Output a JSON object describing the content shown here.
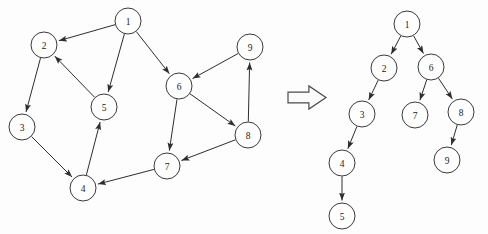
{
  "figure": {
    "width": 488,
    "height": 234,
    "background_color": "#fdfdfd",
    "node_stroke_color": "#3a3a3a",
    "node_fill_color": "#ffffff",
    "edge_color": "#2e2e2e",
    "label_color": "#1a1a1a",
    "node_radius": 13
  },
  "transform_arrow": {
    "name": "rightwards-block-arrow",
    "glyph": "⇒",
    "x": 288,
    "y": 86,
    "width": 38,
    "height": 23,
    "fill": "#fbfbfb",
    "stroke": "#4a4a4a"
  },
  "graph": {
    "name": "source-directed-graph",
    "nodes": [
      {
        "id": "1",
        "label": "1",
        "cx": 128,
        "cy": 21
      },
      {
        "id": "2",
        "label": "2",
        "cx": 44,
        "cy": 45
      },
      {
        "id": "3",
        "label": "3",
        "cx": 22,
        "cy": 127
      },
      {
        "id": "4",
        "label": "4",
        "cx": 83,
        "cy": 188
      },
      {
        "id": "5",
        "label": "5",
        "cx": 104,
        "cy": 107
      },
      {
        "id": "6",
        "label": "6",
        "cx": 179,
        "cy": 86
      },
      {
        "id": "7",
        "label": "7",
        "cx": 167,
        "cy": 166
      },
      {
        "id": "8",
        "label": "8",
        "cx": 248,
        "cy": 135
      },
      {
        "id": "9",
        "label": "9",
        "cx": 250,
        "cy": 47
      }
    ],
    "edges": [
      {
        "from": "1",
        "to": "2"
      },
      {
        "from": "1",
        "to": "5"
      },
      {
        "from": "1",
        "to": "6"
      },
      {
        "from": "2",
        "to": "3"
      },
      {
        "from": "3",
        "to": "4"
      },
      {
        "from": "4",
        "to": "5"
      },
      {
        "from": "5",
        "to": "2"
      },
      {
        "from": "6",
        "to": "7"
      },
      {
        "from": "6",
        "to": "8"
      },
      {
        "from": "7",
        "to": "4"
      },
      {
        "from": "8",
        "to": "7"
      },
      {
        "from": "8",
        "to": "9"
      },
      {
        "from": "9",
        "to": "6"
      }
    ]
  },
  "tree": {
    "name": "spanning-tree",
    "nodes": [
      {
        "id": "1",
        "label": "1",
        "cx": 407,
        "cy": 24
      },
      {
        "id": "2",
        "label": "2",
        "cx": 384,
        "cy": 68
      },
      {
        "id": "6",
        "label": "6",
        "cx": 431,
        "cy": 67
      },
      {
        "id": "3",
        "label": "3",
        "cx": 362,
        "cy": 114
      },
      {
        "id": "7",
        "label": "7",
        "cx": 415,
        "cy": 115
      },
      {
        "id": "8",
        "label": "8",
        "cx": 461,
        "cy": 112
      },
      {
        "id": "4",
        "label": "4",
        "cx": 342,
        "cy": 163
      },
      {
        "id": "9",
        "label": "9",
        "cx": 447,
        "cy": 160
      },
      {
        "id": "5",
        "label": "5",
        "cx": 342,
        "cy": 216
      }
    ],
    "edges": [
      {
        "from": "1",
        "to": "2"
      },
      {
        "from": "1",
        "to": "6"
      },
      {
        "from": "2",
        "to": "3"
      },
      {
        "from": "3",
        "to": "4"
      },
      {
        "from": "4",
        "to": "5"
      },
      {
        "from": "6",
        "to": "7"
      },
      {
        "from": "6",
        "to": "8"
      },
      {
        "from": "8",
        "to": "9"
      }
    ]
  }
}
